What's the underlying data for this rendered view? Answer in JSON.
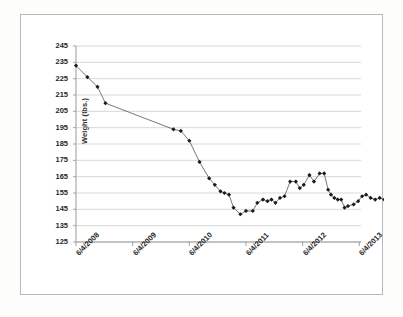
{
  "chart_data": {
    "type": "line",
    "title": "",
    "subtitle": "",
    "xlabel": "",
    "ylabel": "Weight (lbs.)",
    "ylim": [
      125,
      245
    ],
    "ytick_step": 10,
    "yticks": [
      245,
      235,
      225,
      215,
      205,
      195,
      185,
      175,
      165,
      155,
      145,
      135,
      125
    ],
    "xticks": [
      "6/4/2008",
      "6/4/2009",
      "6/4/2010",
      "6/4/2011",
      "6/4/2012",
      "6/4/2013"
    ],
    "xlim": [
      "6/4/2008",
      "6/4/2013.3"
    ],
    "grid": "horizontal",
    "legend": "none",
    "marker": "filled-diamond",
    "marker_color": "#1a1a1a",
    "line_color": "#555555",
    "series": [
      {
        "name": "Weight",
        "x": [
          0.0,
          0.2,
          0.38,
          0.52,
          1.72,
          1.85,
          2.0,
          2.18,
          2.35,
          2.45,
          2.55,
          2.62,
          2.7,
          2.78,
          2.9,
          3.0,
          3.12,
          3.2,
          3.3,
          3.38,
          3.45,
          3.52,
          3.6,
          3.68,
          3.78,
          3.88,
          3.95,
          4.02,
          4.12,
          4.2,
          4.3,
          4.38,
          4.45,
          4.5,
          4.56,
          4.62,
          4.68,
          4.74,
          4.8,
          4.9,
          4.98,
          5.05,
          5.12,
          5.2,
          5.28,
          5.36,
          5.44,
          5.5,
          5.58,
          5.66,
          5.74,
          5.8,
          5.86
        ],
        "values": [
          233,
          226,
          220,
          210,
          194,
          193,
          187,
          174,
          164,
          160,
          156,
          155,
          154,
          146,
          142,
          144,
          144,
          149,
          151,
          150,
          151,
          149,
          152,
          153,
          162,
          162,
          158,
          160,
          166,
          162,
          167,
          167,
          157,
          154,
          152,
          151,
          151,
          146,
          147,
          148,
          150,
          153,
          154,
          152,
          151,
          152,
          151,
          151,
          151,
          151,
          151,
          151,
          151
        ]
      }
    ]
  },
  "axis": {
    "y_title": "Weight (lbs.)"
  }
}
